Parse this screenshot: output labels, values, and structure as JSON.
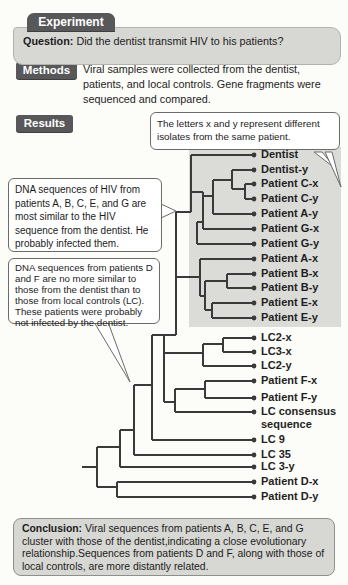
{
  "experiment": {
    "tab": "Experiment",
    "question_label": "Question:",
    "question_text": "Did the dentist transmit HIV to his patients?"
  },
  "methods": {
    "label": "Methods",
    "text": "Viral samples were collected from the dentist, patients, and local controls. Gene fragments were sequenced and compared."
  },
  "results": {
    "label": "Results"
  },
  "callouts": {
    "isolates": "The letters x and y represent different isolates from the same patient.",
    "similar": "DNA sequences of HIV from patients A, B, C, E, and G are most similar to the HIV sequence from the dentist. He probably infected them.",
    "different": "DNA sequences from patients D and F are no more similar to those from the dentist than to those from local controls (LC). These patients were probably not infected by the dentist."
  },
  "conclusion": {
    "label": "Conclusion:",
    "text": "Viral sequences from patients A, B, C, E, and G cluster with those of the dentist,indicating a close evolutionary relationship.Sequences from patients D and F, along with those of local controls, are more distantly related."
  },
  "colors": {
    "header_bg": "#58585a",
    "header_text": "#ffffff",
    "shade": "#dbdbd7",
    "tree_line": "#3a3a3a",
    "panel_bg": "#d7d7d3",
    "callout_border": "#6b6b68"
  },
  "tree": {
    "type": "phylogenetic-cladogram",
    "tip_end_x": 252,
    "dot_x": 254,
    "tips": [
      {
        "label": "Dentist",
        "y": 155,
        "x0": 191
      },
      {
        "label": "Dentist-y",
        "y": 170,
        "x0": 232
      },
      {
        "label": "Patient C-x",
        "y": 184,
        "x0": 245
      },
      {
        "label": "Patient C-y",
        "y": 199,
        "x0": 245
      },
      {
        "label": "Patient A-y",
        "y": 214,
        "x0": 213
      },
      {
        "label": "Patient G-x",
        "y": 229,
        "x0": 203
      },
      {
        "label": "Patient G-y",
        "y": 244,
        "x0": 197
      },
      {
        "label": "Patient A-x",
        "y": 259,
        "x0": 200
      },
      {
        "label": "Patient B-x",
        "y": 274,
        "x0": 227
      },
      {
        "label": "Patient B-y",
        "y": 288,
        "x0": 227
      },
      {
        "label": "Patient E-x",
        "y": 303,
        "x0": 212
      },
      {
        "label": "Patient E-y",
        "y": 318,
        "x0": 212
      },
      {
        "label": "LC2-x",
        "y": 338,
        "x0": 223
      },
      {
        "label": "LC3-x",
        "y": 352,
        "x0": 223
      },
      {
        "label": "LC2-y",
        "y": 366,
        "x0": 203
      },
      {
        "label": "Patient F-x",
        "y": 381,
        "x0": 205
      },
      {
        "label": "Patient F-y",
        "y": 398,
        "x0": 205
      },
      {
        "label": "LC consensus",
        "label2": "sequence",
        "y": 412,
        "x0": 175
      },
      {
        "label": "LC 9",
        "y": 440,
        "x0": 152
      },
      {
        "label": "LC 35",
        "y": 455,
        "x0": 134
      },
      {
        "label": "LC 3-y",
        "y": 467,
        "x0": 120
      },
      {
        "label": "Patient D-x",
        "y": 482,
        "x0": 117
      },
      {
        "label": "Patient D-y",
        "y": 497,
        "x0": 117
      }
    ],
    "segments": [
      [
        245,
        184,
        245,
        199
      ],
      [
        232,
        189,
        245,
        189
      ],
      [
        232,
        170,
        232,
        189
      ],
      [
        213,
        180,
        232,
        180
      ],
      [
        213,
        180,
        213,
        214
      ],
      [
        203,
        196,
        213,
        196
      ],
      [
        203,
        192,
        203,
        229
      ],
      [
        191,
        192,
        203,
        192
      ],
      [
        197,
        222,
        203,
        222
      ],
      [
        197,
        222,
        197,
        244
      ],
      [
        191,
        155,
        191,
        212
      ],
      [
        176,
        212,
        191,
        212
      ],
      [
        176,
        212,
        176,
        335
      ],
      [
        176,
        277,
        200,
        277
      ],
      [
        200,
        259,
        200,
        296
      ],
      [
        200,
        296,
        205,
        296
      ],
      [
        205,
        281,
        205,
        310
      ],
      [
        205,
        281,
        227,
        281
      ],
      [
        227,
        274,
        227,
        288
      ],
      [
        205,
        310,
        212,
        310
      ],
      [
        212,
        303,
        212,
        318
      ],
      [
        152,
        335,
        176,
        335
      ],
      [
        164,
        335,
        164,
        402
      ],
      [
        164,
        353,
        203,
        353
      ],
      [
        203,
        344,
        203,
        366
      ],
      [
        203,
        344,
        223,
        344
      ],
      [
        223,
        338,
        223,
        352
      ],
      [
        164,
        402,
        175,
        402
      ],
      [
        175,
        389,
        175,
        412
      ],
      [
        175,
        389,
        205,
        389
      ],
      [
        205,
        381,
        205,
        398
      ],
      [
        152,
        335,
        152,
        440
      ],
      [
        134,
        385,
        152,
        385
      ],
      [
        134,
        385,
        134,
        455
      ],
      [
        120,
        430,
        134,
        430
      ],
      [
        120,
        430,
        120,
        467
      ],
      [
        97,
        447,
        120,
        447
      ],
      [
        97,
        447,
        97,
        487
      ],
      [
        82,
        467,
        97,
        467
      ],
      [
        97,
        487,
        117,
        487
      ],
      [
        117,
        482,
        117,
        497
      ]
    ]
  }
}
